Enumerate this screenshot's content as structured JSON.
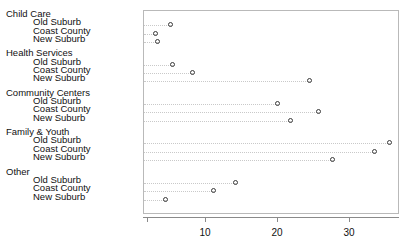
{
  "chart_data": {
    "type": "scatter",
    "subtype": "cleveland-dot-plot",
    "title": "",
    "subtitle": "",
    "xlabel": "",
    "ylabel": "",
    "xlim": [
      2,
      37
    ],
    "grid": false,
    "legend": null,
    "axis": {
      "tick_values": [
        2,
        10,
        20,
        30
      ],
      "tick_labels": [
        "",
        "10",
        "20",
        "30"
      ]
    },
    "marker": {
      "shape": "open-circle",
      "edge_color": "#3a3a3a",
      "fill_color": "none"
    },
    "leader_line": {
      "style": "dotted",
      "color": "#c9c9c9"
    },
    "categories": [
      "Old Suburb",
      "Coast County",
      "New Suburb"
    ],
    "groups": [
      {
        "name": "Child Care",
        "rows": [
          {
            "label": "Old Suburb",
            "value": 5.1
          },
          {
            "label": "Coast County",
            "value": 3.1
          },
          {
            "label": "New Suburb",
            "value": 3.3
          }
        ]
      },
      {
        "name": "Health Services",
        "rows": [
          {
            "label": "Old Suburb",
            "value": 5.4
          },
          {
            "label": "Coast County",
            "value": 8.2
          },
          {
            "label": "New Suburb",
            "value": 24.4
          }
        ]
      },
      {
        "name": "Community Centers",
        "rows": [
          {
            "label": "Old Suburb",
            "value": 20.0
          },
          {
            "label": "Coast County",
            "value": 25.7
          },
          {
            "label": "New Suburb",
            "value": 21.8
          }
        ]
      },
      {
        "name": "Family & Youth",
        "rows": [
          {
            "label": "Old Suburb",
            "value": 35.6
          },
          {
            "label": "Coast County",
            "value": 33.5
          },
          {
            "label": "New Suburb",
            "value": 27.6
          }
        ]
      },
      {
        "name": "Other",
        "rows": [
          {
            "label": "Old Suburb",
            "value": 14.2
          },
          {
            "label": "Coast County",
            "value": 11.1
          },
          {
            "label": "New Suburb",
            "value": 4.4
          }
        ]
      }
    ]
  }
}
